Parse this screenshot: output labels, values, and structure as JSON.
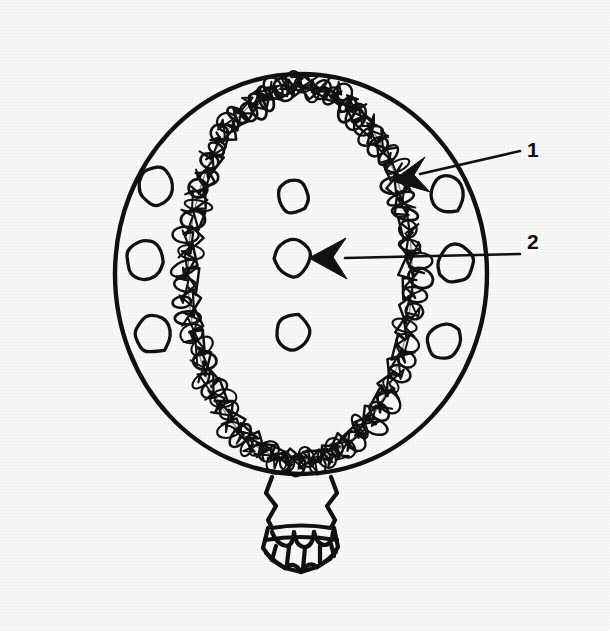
{
  "figure": {
    "kind": "hand-drawn-anatomical-line-diagram",
    "background_color": "#f8f8f6",
    "ink_color": "#111111",
    "labels": [
      {
        "id": "1",
        "text": "1",
        "x": 527,
        "y": 139,
        "target": "coiled-scribble-band",
        "arrow": {
          "tail_x": 519,
          "tail_y": 152,
          "tip_x": 392,
          "tip_y": 181,
          "head": "solid-concave-triangle"
        }
      },
      {
        "id": "2",
        "text": "2",
        "x": 527,
        "y": 231,
        "target": "center-circle-middle",
        "arrow": {
          "tail_x": 519,
          "tail_y": 255,
          "tip_x": 309,
          "tip_y": 258,
          "head": "solid-concave-triangle"
        }
      }
    ],
    "outer_circle": {
      "name": "outer-boundary-circle",
      "cx": 301,
      "cy": 274,
      "rx": 186,
      "ry": 200,
      "stroke_width": 4.2
    },
    "inner_oval": {
      "name": "inner-oval-boundary",
      "cx": 300,
      "cy": 273,
      "rx": 112,
      "ry": 188
    },
    "coil_band": {
      "name": "coiled-scribble-band",
      "loop_count": 150,
      "band_thickness": 22,
      "stroke_width": 2.3
    },
    "small_circles": [
      {
        "name": "left-circle-top",
        "cx": 156,
        "cy": 186,
        "rx": 17,
        "ry": 19
      },
      {
        "name": "left-circle-middle",
        "cx": 145,
        "cy": 260,
        "rx": 19,
        "ry": 19
      },
      {
        "name": "left-circle-bottom",
        "cx": 153,
        "cy": 334,
        "rx": 18,
        "ry": 19
      },
      {
        "name": "center-circle-top",
        "cx": 293,
        "cy": 196,
        "rx": 16,
        "ry": 17
      },
      {
        "name": "center-circle-middle",
        "cx": 293,
        "cy": 258,
        "rx": 18,
        "ry": 19
      },
      {
        "name": "center-circle-bottom",
        "cx": 293,
        "cy": 333,
        "rx": 17,
        "ry": 18
      },
      {
        "name": "right-circle-top",
        "cx": 446,
        "cy": 195,
        "rx": 17,
        "ry": 19
      },
      {
        "name": "right-circle-middle",
        "cx": 456,
        "cy": 263,
        "rx": 18,
        "ry": 20
      },
      {
        "name": "right-circle-bottom",
        "cx": 444,
        "cy": 341,
        "rx": 17,
        "ry": 18
      }
    ],
    "stem": {
      "name": "pleated-neck-stem",
      "top_y": 474,
      "bottom_y": 568,
      "center_x": 301,
      "pleat_count": 4
    }
  }
}
